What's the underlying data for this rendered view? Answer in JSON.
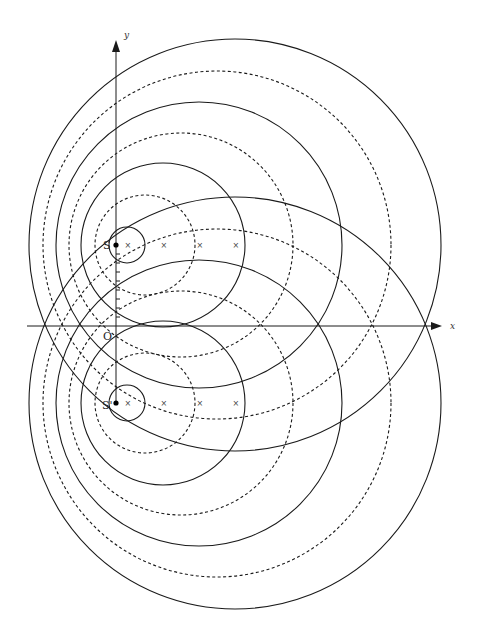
{
  "diagram": {
    "axes": {
      "x_label": "x",
      "y_label": "y",
      "origin_label": "O",
      "origin": [
        116,
        326
      ],
      "x_range_px": [
        27,
        440
      ],
      "y_range_px": [
        403,
        40
      ]
    },
    "sources": [
      {
        "label": "S",
        "position": [
          116,
          245
        ]
      },
      {
        "label": "S'",
        "position": [
          116,
          403
        ]
      }
    ],
    "center_markers": {
      "glyph": "×",
      "x_positions": [
        127,
        163,
        199,
        235
      ]
    },
    "wavefronts": {
      "solid": [
        {
          "cx": 127,
          "r": 18
        },
        {
          "cx": 163,
          "r": 82
        },
        {
          "cx": 199,
          "r": 143
        },
        {
          "cx": 235,
          "r": 206
        }
      ],
      "dashed": [
        {
          "cx": 145,
          "r": 50
        },
        {
          "cx": 181,
          "r": 112
        },
        {
          "cx": 217,
          "r": 174
        }
      ]
    },
    "colors": {
      "ink": "#1a1a1a",
      "background": "#ffffff"
    }
  }
}
